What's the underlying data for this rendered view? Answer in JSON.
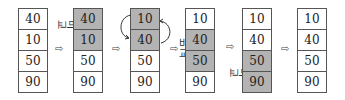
{
  "steps": [
    {
      "values": [
        "40",
        "10",
        "50",
        "90"
      ],
      "highlight": [
        false,
        false,
        false,
        false
      ]
    },
    {
      "values": [
        "40",
        "10",
        "50",
        "90"
      ],
      "highlight": [
        true,
        true,
        false,
        false
      ]
    },
    {
      "values": [
        "10",
        "40",
        "50",
        "90"
      ],
      "highlight": [
        true,
        true,
        false,
        false
      ]
    },
    {
      "values": [
        "10",
        "40",
        "50",
        "90"
      ],
      "highlight": [
        false,
        true,
        true,
        false
      ]
    },
    {
      "values": [
        "10",
        "40",
        "50",
        "90"
      ],
      "highlight": [
        false,
        false,
        true,
        true
      ]
    },
    {
      "values": [
        "10",
        "40",
        "50",
        "90"
      ],
      "highlight": [
        false,
        false,
        false,
        false
      ]
    }
  ],
  "compare_label": [
    "비",
    "교"
  ],
  "arrow_glyph": "⇨",
  "colors": {
    "highlight": "#b3b3b3",
    "border": "#555555"
  }
}
